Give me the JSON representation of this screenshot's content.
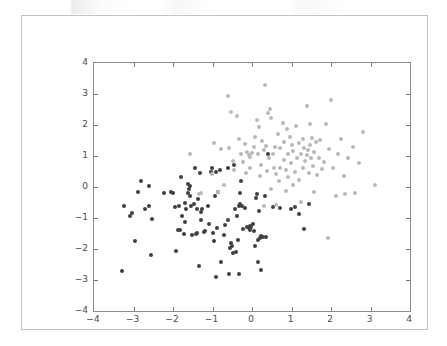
{
  "figure": {
    "background_color": "#ffffff",
    "frame_border_color": "#c2c2c2",
    "axes_border_color": "#8d8d8d"
  },
  "chart_data": {
    "type": "scatter",
    "title": "",
    "xlabel": "",
    "ylabel": "",
    "xlim": [
      -4,
      4
    ],
    "ylim": [
      -4,
      4
    ],
    "xticks": [
      -4,
      -3,
      -2,
      -1,
      0,
      1,
      2,
      3,
      4
    ],
    "yticks": [
      -4,
      -3,
      -2,
      -1,
      0,
      1,
      2,
      3,
      4
    ],
    "xticklabels": [
      "−4",
      "−3",
      "−2",
      "−1",
      "0",
      "1",
      "2",
      "3",
      "4"
    ],
    "yticklabels": [
      "−4",
      "−3",
      "−2",
      "−1",
      "0",
      "1",
      "2",
      "3",
      "4"
    ],
    "grid": false,
    "legend": null,
    "marker_size_px": 4,
    "series": [
      {
        "name": "class-0",
        "color": "#404040",
        "points": [
          [
            -3.3,
            -2.72
          ],
          [
            -3.25,
            -0.62
          ],
          [
            -3.1,
            -0.93
          ],
          [
            -3.05,
            -0.85
          ],
          [
            -2.95,
            -1.75
          ],
          [
            -2.88,
            -0.15
          ],
          [
            -2.82,
            0.18
          ],
          [
            -2.72,
            -0.7
          ],
          [
            -2.62,
            -0.62
          ],
          [
            -2.6,
            0.02
          ],
          [
            -2.55,
            -2.2
          ],
          [
            -2.52,
            -1.02
          ],
          [
            -2.22,
            -0.18
          ],
          [
            -2.05,
            -0.16
          ],
          [
            -2.0,
            -0.18
          ],
          [
            -1.92,
            -2.05
          ],
          [
            -1.88,
            -1.38
          ],
          [
            -1.85,
            -0.62
          ],
          [
            -1.82,
            -1.4
          ],
          [
            -1.8,
            0.32
          ],
          [
            -1.78,
            -0.95
          ],
          [
            -1.72,
            -1.52
          ],
          [
            -1.7,
            -0.52
          ],
          [
            -1.68,
            -0.72
          ],
          [
            -1.62,
            0.1
          ],
          [
            -1.6,
            -0.08
          ],
          [
            -1.58,
            0.02
          ],
          [
            -1.56,
            -0.3
          ],
          [
            -1.55,
            -0.6
          ],
          [
            -1.52,
            -1.55
          ],
          [
            -1.48,
            -0.55
          ],
          [
            -1.45,
            0.62
          ],
          [
            -1.42,
            -1.52
          ],
          [
            -1.4,
            -1.48
          ],
          [
            -1.38,
            -0.72
          ],
          [
            -1.36,
            -0.4
          ],
          [
            -1.34,
            -2.55
          ],
          [
            -1.32,
            0.45
          ],
          [
            -1.3,
            -0.8
          ],
          [
            -1.28,
            -1.05
          ],
          [
            -1.26,
            -0.7
          ],
          [
            -1.22,
            -1.45
          ],
          [
            -1.18,
            -1.42
          ],
          [
            -1.12,
            -0.62
          ],
          [
            -1.08,
            -1.18
          ],
          [
            -1.05,
            0.5
          ],
          [
            -1.02,
            0.62
          ],
          [
            -0.98,
            -1.48
          ],
          [
            -0.96,
            -1.75
          ],
          [
            -0.94,
            -0.3
          ],
          [
            -0.92,
            -2.9
          ],
          [
            -0.9,
            0.48
          ],
          [
            -0.88,
            -1.32
          ],
          [
            -0.86,
            -0.15
          ],
          [
            -0.82,
            0.55
          ],
          [
            -0.78,
            -2.42
          ],
          [
            -0.72,
            -1.55
          ],
          [
            -0.68,
            -1.22
          ],
          [
            -0.62,
            0.6
          ],
          [
            -0.58,
            -2.82
          ],
          [
            -0.55,
            -1.98
          ],
          [
            -0.52,
            -1.82
          ],
          [
            -0.5,
            -1.9
          ],
          [
            -0.48,
            -2.12
          ],
          [
            -0.46,
            0.72
          ],
          [
            -0.42,
            -0.7
          ],
          [
            -0.4,
            -2.1
          ],
          [
            -0.38,
            -0.95
          ],
          [
            -0.36,
            -1.72
          ],
          [
            -0.34,
            -0.62
          ],
          [
            -0.32,
            -2.82
          ],
          [
            -0.3,
            -0.55
          ],
          [
            -0.28,
            0.18
          ],
          [
            -0.26,
            -0.6
          ],
          [
            -0.22,
            -1.35
          ],
          [
            -0.18,
            -0.68
          ],
          [
            -0.12,
            -1.28
          ],
          [
            -0.08,
            -1.32
          ],
          [
            -0.06,
            -1.38
          ],
          [
            -0.04,
            -1.25
          ],
          [
            -0.02,
            -1.3
          ],
          [
            0.02,
            -1.2
          ],
          [
            0.05,
            -1.42
          ],
          [
            0.08,
            -1.9
          ],
          [
            0.1,
            -0.35
          ],
          [
            0.12,
            -0.22
          ],
          [
            0.14,
            -1.72
          ],
          [
            0.16,
            -2.42
          ],
          [
            0.18,
            -0.78
          ],
          [
            0.2,
            -1.65
          ],
          [
            0.22,
            -1.58
          ],
          [
            0.24,
            -2.68
          ],
          [
            0.28,
            -1.62
          ],
          [
            0.32,
            -0.3
          ],
          [
            0.36,
            -1.62
          ],
          [
            0.4,
            1.05
          ],
          [
            0.52,
            -0.65
          ],
          [
            0.72,
            -0.68
          ],
          [
            0.98,
            -0.72
          ],
          [
            1.1,
            -0.65
          ],
          [
            1.2,
            -0.88
          ],
          [
            1.32,
            -1.35
          ],
          [
            1.45,
            -0.55
          ],
          [
            -1.62,
            -0.2
          ],
          [
            -1.7,
            -1.12
          ],
          [
            -1.95,
            -0.65
          ],
          [
            -0.3,
            -0.18
          ],
          [
            -0.62,
            -1.08
          ]
        ]
      },
      {
        "name": "class-1",
        "color": "#b9b9b9",
        "points": [
          [
            -1.58,
            1.05
          ],
          [
            -1.35,
            -0.22
          ],
          [
            -1.28,
            -0.18
          ],
          [
            -1.02,
            0.42
          ],
          [
            -0.95,
            1.42
          ],
          [
            -0.85,
            -0.15
          ],
          [
            -0.78,
            1.22
          ],
          [
            -0.72,
            0.08
          ],
          [
            -0.62,
            2.95
          ],
          [
            -0.58,
            1.25
          ],
          [
            -0.52,
            2.42
          ],
          [
            -0.48,
            0.85
          ],
          [
            -0.45,
            0.55
          ],
          [
            -0.38,
            2.3
          ],
          [
            -0.32,
            1.55
          ],
          [
            -0.28,
            1.08
          ],
          [
            -0.22,
            0.82
          ],
          [
            -0.18,
            1.38
          ],
          [
            -0.12,
            1.12
          ],
          [
            -0.08,
            1.02
          ],
          [
            -0.05,
            0.98
          ],
          [
            0.0,
            1.1
          ],
          [
            0.05,
            1.28
          ],
          [
            0.08,
            1.62
          ],
          [
            0.12,
            2.15
          ],
          [
            0.15,
            1.05
          ],
          [
            0.18,
            1.95
          ],
          [
            0.22,
            0.72
          ],
          [
            0.26,
            1.48
          ],
          [
            0.3,
            1.18
          ],
          [
            0.32,
            3.28
          ],
          [
            0.35,
            1.32
          ],
          [
            0.38,
            0.52
          ],
          [
            0.4,
            2.38
          ],
          [
            0.42,
            0.95
          ],
          [
            0.45,
            2.52
          ],
          [
            0.48,
            2.22
          ],
          [
            0.52,
            1.08
          ],
          [
            0.55,
            0.62
          ],
          [
            0.58,
            1.3
          ],
          [
            0.62,
            0.42
          ],
          [
            0.65,
            1.72
          ],
          [
            0.68,
            0.18
          ],
          [
            0.72,
            1.25
          ],
          [
            0.78,
            2.05
          ],
          [
            0.8,
            0.88
          ],
          [
            0.82,
            1.45
          ],
          [
            0.85,
            0.55
          ],
          [
            0.88,
            1.88
          ],
          [
            0.9,
            1.05
          ],
          [
            0.92,
            0.32
          ],
          [
            0.95,
            1.62
          ],
          [
            0.98,
            0.78
          ],
          [
            1.02,
            1.35
          ],
          [
            1.05,
            1.15
          ],
          [
            1.08,
            0.48
          ],
          [
            1.12,
            1.98
          ],
          [
            1.15,
            0.92
          ],
          [
            1.18,
            1.42
          ],
          [
            1.2,
            0.22
          ],
          [
            1.24,
            1.08
          ],
          [
            1.28,
            0.62
          ],
          [
            1.3,
            1.55
          ],
          [
            1.32,
            1.25
          ],
          [
            1.35,
            0.85
          ],
          [
            1.38,
            1.02
          ],
          [
            1.4,
            2.62
          ],
          [
            1.42,
            1.18
          ],
          [
            1.45,
            0.45
          ],
          [
            1.48,
            1.35
          ],
          [
            1.5,
            0.95
          ],
          [
            1.52,
            1.58
          ],
          [
            1.55,
            0.68
          ],
          [
            1.58,
            1.12
          ],
          [
            1.62,
            1.45
          ],
          [
            1.65,
            0.38
          ],
          [
            1.7,
            0.92
          ],
          [
            1.72,
            1.52
          ],
          [
            1.78,
            0.58
          ],
          [
            1.82,
            0.82
          ],
          [
            1.88,
            2.02
          ],
          [
            1.92,
            -1.65
          ],
          [
            1.95,
            1.22
          ],
          [
            2.0,
            2.82
          ],
          [
            2.05,
            0.62
          ],
          [
            2.12,
            -0.28
          ],
          [
            2.18,
            1.08
          ],
          [
            2.25,
            1.55
          ],
          [
            2.32,
            0.35
          ],
          [
            2.42,
            0.95
          ],
          [
            2.55,
            1.28
          ],
          [
            2.62,
            -0.18
          ],
          [
            2.72,
            0.78
          ],
          [
            2.82,
            1.78
          ],
          [
            3.12,
            0.05
          ],
          [
            2.35,
            -0.22
          ],
          [
            1.25,
            -0.48
          ],
          [
            0.62,
            -0.58
          ],
          [
            0.3,
            -0.62
          ],
          [
            -0.15,
            0.45
          ],
          [
            0.48,
            -0.05
          ],
          [
            0.85,
            -0.12
          ],
          [
            1.05,
            0.05
          ],
          [
            0.2,
            0.35
          ],
          [
            -0.05,
            0.62
          ],
          [
            1.58,
            -0.15
          ],
          [
            0.7,
            0.62
          ],
          [
            1.48,
            2.02
          ]
        ]
      }
    ]
  }
}
